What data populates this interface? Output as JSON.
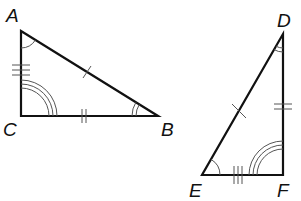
{
  "diagram": {
    "type": "congruent-triangles",
    "triangles": [
      {
        "name": "ABC",
        "vertices": [
          {
            "label": "A",
            "x": 21,
            "y": 31,
            "lx": 6,
            "ly": 22
          },
          {
            "label": "B",
            "x": 158,
            "y": 116,
            "lx": 161,
            "ly": 136
          },
          {
            "label": "C",
            "x": 21,
            "y": 116,
            "lx": 3,
            "ly": 136
          }
        ],
        "side_marks": {
          "AB": 1,
          "CB": 2,
          "AC": 3
        },
        "angle_marks": {
          "A": 1,
          "B": 2,
          "C": 3
        }
      },
      {
        "name": "DEF",
        "vertices": [
          {
            "label": "D",
            "x": 283,
            "y": 34,
            "lx": 277,
            "ly": 27
          },
          {
            "label": "E",
            "x": 202,
            "y": 175,
            "lx": 189,
            "ly": 197
          },
          {
            "label": "F",
            "x": 283,
            "y": 175,
            "lx": 277,
            "ly": 197
          }
        ],
        "side_marks": {
          "DE": 1,
          "DF": 2,
          "EF": 3
        },
        "angle_marks": {
          "E": 1,
          "D": 2,
          "F": 3
        }
      }
    ],
    "colors": {
      "edge": "#111111",
      "mark": "#555555",
      "label": "#111111"
    }
  }
}
